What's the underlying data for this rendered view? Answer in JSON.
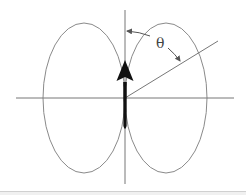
{
  "diagram": {
    "angle_label": "θ",
    "colors": {
      "line": "#777777",
      "lobe": "#8a8a8a",
      "arrow": "#111111",
      "background": "#ffffff"
    },
    "geometry": {
      "origin": [
        125,
        98
      ],
      "horizontal_axis": {
        "x1": 16,
        "x2": 234,
        "y": 98
      },
      "vertical_axis": {
        "x": 125,
        "y1": 10,
        "y2": 184
      },
      "lobes": [
        {
          "name": "left",
          "cx": 84,
          "cy": 98,
          "rx": 41,
          "ry": 75
        },
        {
          "name": "right",
          "cx": 166,
          "cy": 98,
          "rx": 41,
          "ry": 75
        }
      ],
      "ray": {
        "x1": 125,
        "y1": 98,
        "x2": 218,
        "y2": 41
      },
      "dipole_arrow": {
        "x": 125,
        "tail_y": 130,
        "head_tip_y": 60,
        "head_base_y": 80
      }
    }
  }
}
